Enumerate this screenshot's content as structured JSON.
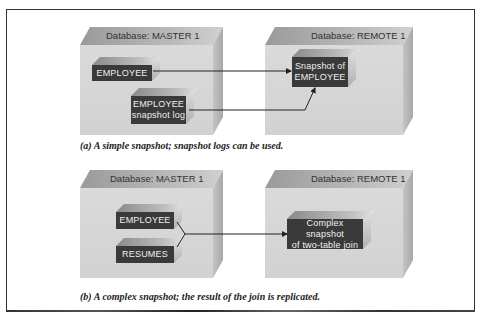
{
  "diagram": {
    "panel_a": {
      "master_db": {
        "title": "Database: MASTER 1"
      },
      "remote_db": {
        "title": "Database: REMOTE 1"
      },
      "tables": {
        "employee": "EMPLOYEE",
        "employee_log_line1": "EMPLOYEE",
        "employee_log_line2": "snapshot log",
        "snapshot_line1": "Snapshot of",
        "snapshot_line2": "EMPLOYEE"
      },
      "caption": "(a) A simple snapshot; snapshot logs can be used."
    },
    "panel_b": {
      "master_db": {
        "title": "Database: MASTER 1"
      },
      "remote_db": {
        "title": "Database: REMOTE 1"
      },
      "tables": {
        "employee": "EMPLOYEE",
        "resumes": "RESUMES",
        "complex_line1": "Complex snapshot",
        "complex_line2": "of two-table join"
      },
      "caption": "(b) A complex snapshot; the result of the join is replicated."
    },
    "colors": {
      "table_fill": "#3a3a3a",
      "db_front": "#d6d6d6",
      "border": "#333333"
    }
  }
}
